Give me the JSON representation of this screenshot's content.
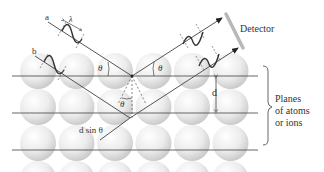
{
  "diagram": {
    "labels": {
      "ray_a": "a",
      "ray_b": "b",
      "wavelength": "λ",
      "theta": "θ",
      "spacing": "d",
      "path_difference": "d sin θ",
      "detector": "Detector",
      "planes_line1": "Planes",
      "planes_line2": "of atoms",
      "planes_line3": "or ions"
    },
    "colors": {
      "line": "#555555",
      "atom_light": "#f7f7f7",
      "atom_dark": "#c9c9c9",
      "detector": "#b8b8b8",
      "text": "#333333"
    },
    "lattice": {
      "rows": 4,
      "columns": 6,
      "planes": 3
    }
  }
}
